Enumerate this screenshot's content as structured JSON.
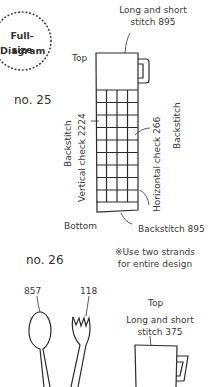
{
  "badge": {
    "line1": "Full-size",
    "line2": "Diagram"
  },
  "design25": {
    "number": "no. 25",
    "label_top": "Top",
    "label_bottom": "Bottom",
    "callout_top_line1": "Long and short",
    "callout_top_line2": "stitch 895",
    "left_label_backstitch": "Backstitch",
    "left_label_vertical": "Vertical check 2224",
    "right_label_horizontal": "Horizontal check 266",
    "right_label_backstitch": "Backstitch",
    "callout_bottom": "Backstitch 895",
    "grid": {
      "columns": 4,
      "rows": 9
    }
  },
  "note": {
    "line1": "※Use two strands",
    "line2": "for entire design"
  },
  "design26": {
    "number": "no. 26",
    "spoon_color": "857",
    "fork_color": "118",
    "label_top": "Top",
    "callout_top_line1": "Long and short",
    "callout_top_line2": "stitch 375"
  },
  "colors": {
    "line": "#2b2b2b",
    "text": "#3a3a3a",
    "background": "#ffffff"
  }
}
